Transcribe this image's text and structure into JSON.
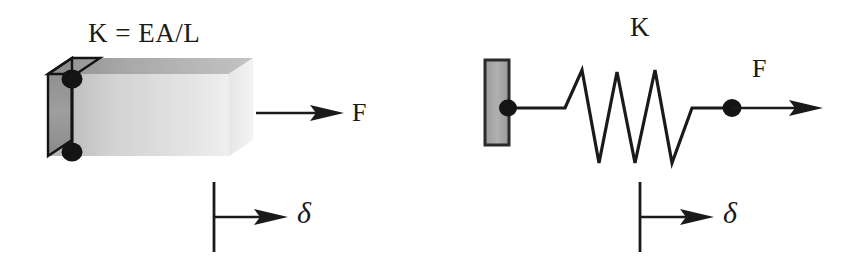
{
  "figure": {
    "background_color": "#ffffff",
    "ink_color": "#1a1a1a",
    "bar_fill_light": "#e8e8e8",
    "bar_fill_mid": "#c9c9c9",
    "bar_fill_dark": "#a0a0a0",
    "wall_fill": "#a8a8a8"
  },
  "bar_diagram": {
    "name": "axial-bar-element",
    "stiffness_formula": "K = EA/L",
    "force_label": "F",
    "displacement_label": "δ",
    "node_count": 2
  },
  "spring_diagram": {
    "name": "equivalent-spring-element",
    "stiffness_label": "K",
    "force_label": "F",
    "displacement_label": "δ",
    "coil_peaks": 3,
    "node_count": 2
  }
}
